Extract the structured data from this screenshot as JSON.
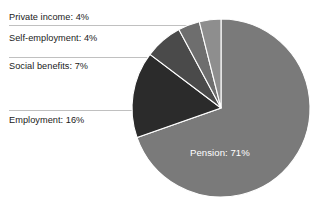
{
  "chart_data": {
    "type": "pie",
    "title": "",
    "categories": [
      "Private income",
      "Self-employment",
      "Social benefits",
      "Employment",
      "Pension"
    ],
    "values": [
      4,
      4,
      7,
      16,
      71
    ],
    "unit": "%",
    "legend": "none",
    "labels_inside": [
      "Pension"
    ],
    "slice_order_clockwise_from_top": [
      "Pension",
      "Employment",
      "Social benefits",
      "Self-employment",
      "Private income"
    ],
    "colors": {
      "Pension": "#7a7a7a",
      "Employment": "#2b2b2b",
      "Social benefits": "#4a4a4a",
      "Self-employment": "#6e6e6e",
      "Private income": "#8e8e8e"
    },
    "slice_labels": [
      "Private income: 4%",
      "Self-employment: 4%",
      "Social benefits: 7%",
      "Employment: 16%",
      "Pension: 71%"
    ]
  },
  "labels": {
    "private_income": "Private income: 4%",
    "self_employment": "Self-employment: 4%",
    "social_benefits": "Social benefits: 7%",
    "employment": "Employment: 16%",
    "pension": "Pension: 71%"
  },
  "colors": {
    "background": "#ffffff",
    "pension_slice": "#7a7a7a",
    "employment_slice": "#2b2b2b",
    "social_benefits_slice": "#4a4a4a",
    "self_employment_slice": "#6e6e6e",
    "private_income_slice": "#8e8e8e",
    "leader_line": "#b4b4b4",
    "label_text": "#1a1a1a",
    "inner_label_text": "#ffffff"
  }
}
